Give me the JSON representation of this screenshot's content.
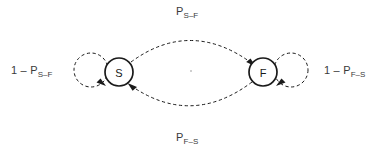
{
  "figure": {
    "type": "state-transition-diagram",
    "title": "",
    "background_color": "#ffffff",
    "stroke_color": "#1a1a1a",
    "text_color": "#3a3a3a"
  },
  "nodes": [
    {
      "id": "S",
      "label": "S",
      "cx": 119,
      "cy": 72,
      "r": 14,
      "stroke_style": "solid"
    },
    {
      "id": "F",
      "label": "F",
      "cx": 263,
      "cy": 72,
      "r": 14,
      "stroke_style": "solid"
    }
  ],
  "edges": [
    {
      "id": "s-to-f",
      "from": "S",
      "to": "F",
      "style": "dashed",
      "shape": "arc-above",
      "arrowhead": "at-target"
    },
    {
      "id": "f-to-s",
      "from": "F",
      "to": "S",
      "style": "dashed",
      "shape": "arc-below",
      "arrowhead": "at-target"
    },
    {
      "id": "s-self-loop",
      "from": "S",
      "to": "S",
      "style": "dashed",
      "shape": "self-loop-left",
      "arrowhead": "at-target"
    },
    {
      "id": "f-self-loop",
      "from": "F",
      "to": "F",
      "style": "dashed",
      "shape": "self-loop-right",
      "arrowhead": "at-target"
    }
  ],
  "labels": {
    "top": {
      "base": "P",
      "subscript": "S–F",
      "edge": "s-to-f"
    },
    "bottom": {
      "base": "P",
      "subscript": "F–S",
      "edge": "f-to-s"
    },
    "left": {
      "base": "1 – P",
      "subscript": "S–F",
      "edge": "s-self-loop"
    },
    "right": {
      "base": "1 – P",
      "subscript": "F–S",
      "edge": "f-self-loop"
    }
  }
}
